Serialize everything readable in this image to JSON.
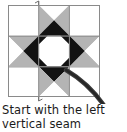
{
  "figure": {
    "caption_lines": [
      "Start with the left",
      "vertical seam"
    ],
    "colors": {
      "background": "#ffffff",
      "fabric_light": "#ffffff",
      "fabric_gray": "#b4b4b4",
      "fabric_dark": "#121212",
      "seam_line": "#8a8a8a",
      "grid_line": "#8a8a8a",
      "thread": "#3a3a3a",
      "text": "#1a1a1a"
    },
    "block": {
      "name": "ohio-star-snowball-block",
      "grid_rows": 3,
      "grid_cols": 3,
      "x": 8,
      "y": 5,
      "size": 92,
      "cells": [
        {
          "row": 0,
          "col": 0,
          "name": "corner-plain-top-left",
          "pattern": "plain",
          "fill": "light"
        },
        {
          "row": 0,
          "col": 1,
          "name": "hourglass-top-center",
          "pattern": "hourglass",
          "orientation": "vertical"
        },
        {
          "row": 0,
          "col": 2,
          "name": "corner-plain-top-right",
          "pattern": "plain",
          "fill": "light"
        },
        {
          "row": 1,
          "col": 0,
          "name": "hourglass-middle-left",
          "pattern": "hourglass",
          "orientation": "horizontal"
        },
        {
          "row": 1,
          "col": 1,
          "name": "center-octagon-snowball",
          "pattern": "snowball-octagon"
        },
        {
          "row": 1,
          "col": 2,
          "name": "hourglass-middle-right",
          "pattern": "hourglass",
          "orientation": "horizontal"
        },
        {
          "row": 2,
          "col": 0,
          "name": "corner-plain-bottom-left",
          "pattern": "plain",
          "fill": "light"
        },
        {
          "row": 2,
          "col": 1,
          "name": "hourglass-bottom-center",
          "pattern": "hourglass",
          "orientation": "vertical"
        },
        {
          "row": 2,
          "col": 2,
          "name": "corner-plain-bottom-right",
          "pattern": "plain",
          "fill": "light"
        }
      ]
    },
    "annotations": {
      "left_vertical_seam": {
        "label": "left vertical seam",
        "x": 38.7,
        "y_top": 1,
        "y_bottom": 101
      },
      "thread_curve": {
        "label": "needle thread",
        "path": "M 66 70 C 83 80, 99 94, 112 118"
      }
    }
  }
}
